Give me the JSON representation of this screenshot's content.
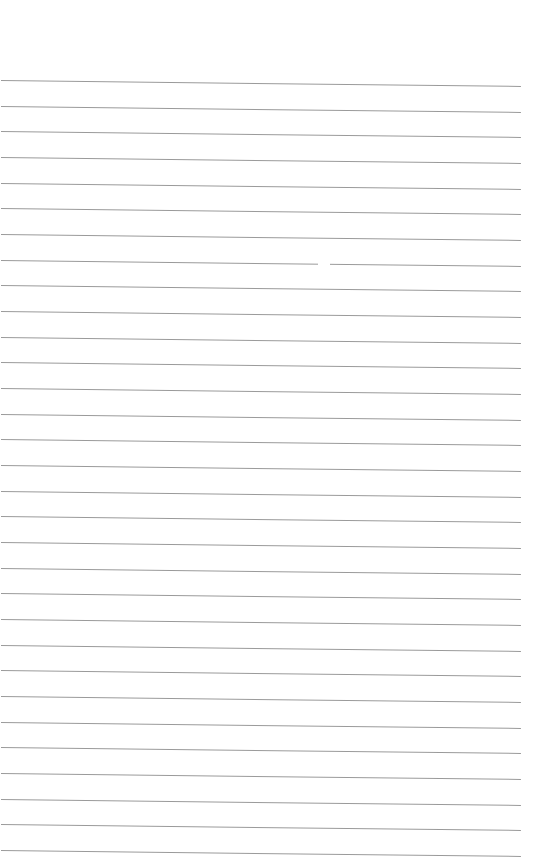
{
  "page": {
    "type": "blank lined paper",
    "line_count": 31,
    "first_line_y": 80,
    "line_spacing": 25.67,
    "line_color": "#9a9a9a",
    "background_color": "#ffffff"
  }
}
